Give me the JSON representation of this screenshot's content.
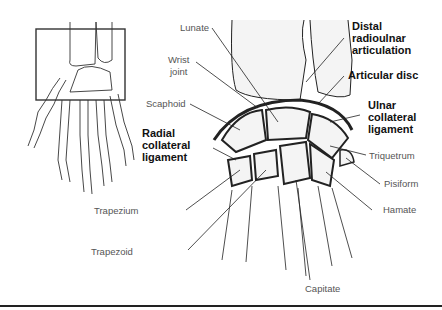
{
  "diagram": {
    "colors": {
      "line": "#222222",
      "label": "#555555",
      "bold_label": "#111111",
      "bone_fill": "#f4f4f4"
    },
    "labels": {
      "lunate": "Lunate",
      "wrist_joint_1": "Wrist",
      "wrist_joint_2": "joint",
      "scaphoid": "Scaphoid",
      "radial_collateral": "Radial\ncollateral\nligament",
      "trapezium": "Trapezium",
      "trapezoid": "Trapezoid",
      "capitate": "Capitate",
      "hamate": "Hamate",
      "pisiform": "Pisiform",
      "triquetrum": "Triquetrum",
      "ulnar_collateral": "Ulnar\ncollateral\nligament",
      "articular_disc": "Articular disc",
      "distal_radioulnar": "Distal\nradioulnar\narticulation"
    }
  }
}
